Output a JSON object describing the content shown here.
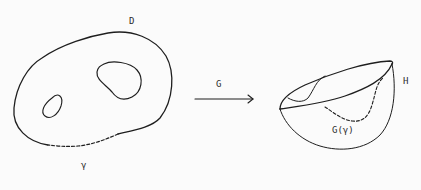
{
  "diagram": {
    "type": "mapping-illustration",
    "labels": {
      "domain": "D",
      "boundary_curve": "γ",
      "map": "G",
      "target_surface": "H",
      "image_curve": "G(γ)"
    },
    "elements": [
      {
        "id": "region-D",
        "desc": "planar region with two holes, boundary partly dashed (γ)"
      },
      {
        "id": "arrow-G",
        "desc": "arrow from D to H labeled G"
      },
      {
        "id": "surface-H",
        "desc": "bowl-shaped surface with dashed image curve G(γ)"
      }
    ],
    "colors": {
      "ink": "#1e1e1e",
      "background": "#fbfbfb"
    }
  }
}
